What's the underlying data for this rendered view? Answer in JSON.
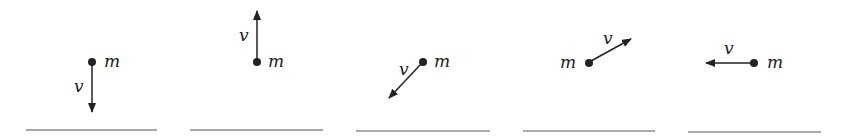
{
  "diagram": {
    "colors": {
      "ink": "#222222",
      "ground": "#555555",
      "background": "#ffffff"
    },
    "panels": [
      {
        "id": 1,
        "mass_label": "m",
        "velocity_label": "v",
        "direction": "down"
      },
      {
        "id": 2,
        "mass_label": "m",
        "velocity_label": "v",
        "direction": "up"
      },
      {
        "id": 3,
        "mass_label": "m",
        "velocity_label": "v",
        "direction": "down-left"
      },
      {
        "id": 4,
        "mass_label": "m",
        "velocity_label": "v",
        "direction": "up-right"
      },
      {
        "id": 5,
        "mass_label": "m",
        "velocity_label": "v",
        "direction": "left"
      }
    ]
  }
}
